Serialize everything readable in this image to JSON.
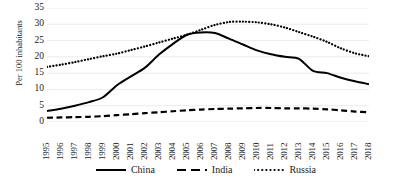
{
  "chart_data": {
    "type": "line",
    "title": "",
    "xlabel": "",
    "ylabel": "Per 100 inhabitants",
    "ylim": [
      0,
      35
    ],
    "yticks": [
      0,
      5,
      10,
      15,
      20,
      25,
      30,
      35
    ],
    "grid": true,
    "legend_position": "bottom",
    "x": [
      1995,
      1996,
      1997,
      1998,
      1999,
      2000,
      2001,
      2002,
      2003,
      2004,
      2005,
      2006,
      2007,
      2008,
      2009,
      2010,
      2011,
      2012,
      2013,
      2014,
      2015,
      2016,
      2017,
      2018
    ],
    "categories": [
      "1995",
      "1996",
      "1997",
      "1998",
      "1999",
      "2000",
      "2001",
      "2002",
      "2003",
      "2004",
      "2005",
      "2006",
      "2007",
      "2008",
      "2009",
      "2010",
      "2011",
      "2012",
      "2013",
      "2014",
      "2015",
      "2016",
      "2017",
      "2018"
    ],
    "series": [
      {
        "name": "China",
        "style": "solid",
        "color": "#000000",
        "values": [
          3.4,
          4.1,
          5.0,
          6.1,
          7.6,
          11.3,
          14.0,
          16.7,
          20.7,
          24.0,
          26.8,
          27.5,
          27.3,
          25.6,
          23.8,
          22.0,
          20.8,
          20.0,
          19.4,
          15.7,
          15.0,
          13.6,
          12.5,
          11.6
        ]
      },
      {
        "name": "India",
        "style": "dashed",
        "color": "#000000",
        "values": [
          1.3,
          1.4,
          1.5,
          1.6,
          1.8,
          2.1,
          2.4,
          2.7,
          3.0,
          3.3,
          3.6,
          3.8,
          4.0,
          4.1,
          4.2,
          4.3,
          4.3,
          4.2,
          4.2,
          4.1,
          3.9,
          3.6,
          3.2,
          3.0
        ]
      },
      {
        "name": "Russia",
        "style": "dotted",
        "color": "#000000",
        "values": [
          16.9,
          17.6,
          18.4,
          19.3,
          20.2,
          21.0,
          22.1,
          23.2,
          24.4,
          25.6,
          26.8,
          28.3,
          29.8,
          30.7,
          30.8,
          30.6,
          30.0,
          29.0,
          27.6,
          26.2,
          24.6,
          22.6,
          21.1,
          20.2
        ]
      }
    ]
  },
  "axes": {
    "y_title": "Per 100 inhabitants",
    "y_tick_labels": [
      "35",
      "30",
      "25",
      "20",
      "15",
      "10",
      "5",
      "0"
    ],
    "x_tick_labels": [
      "1995",
      "1996",
      "1997",
      "1998",
      "1999",
      "2000",
      "2001",
      "2002",
      "2003",
      "2004",
      "2005",
      "2006",
      "2007",
      "2008",
      "2009",
      "2010",
      "2011",
      "2012",
      "2013",
      "2014",
      "2015",
      "2016",
      "2017",
      "2018"
    ]
  },
  "legend": {
    "items": [
      {
        "label": "China",
        "style": "solid"
      },
      {
        "label": "India",
        "style": "dashed"
      },
      {
        "label": "Russia",
        "style": "dotted"
      }
    ]
  },
  "colors": {
    "series": "#000000",
    "gridline": "#e2e2e2",
    "text": "#1a1a1a",
    "background": "#ffffff"
  }
}
